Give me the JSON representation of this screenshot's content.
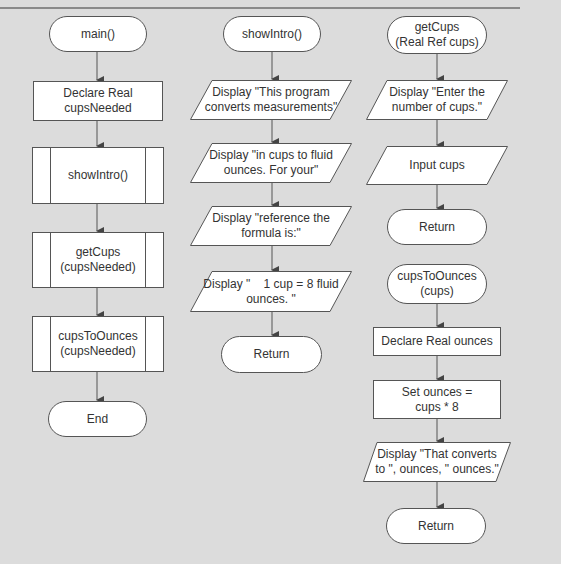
{
  "diagram": {
    "type": "flowchart",
    "columns": [
      {
        "name": "main",
        "nodes": [
          {
            "shape": "terminal",
            "label": "main()"
          },
          {
            "shape": "process",
            "label": "Declare Real\ncupsNeeded"
          },
          {
            "shape": "predefined-process",
            "label": "showIntro()"
          },
          {
            "shape": "predefined-process",
            "label": "getCups\n(cupsNeeded)"
          },
          {
            "shape": "predefined-process",
            "label": "cupsToOunces\n(cupsNeeded)"
          },
          {
            "shape": "terminal",
            "label": "End"
          }
        ]
      },
      {
        "name": "showIntro",
        "nodes": [
          {
            "shape": "terminal",
            "label": "showIntro()"
          },
          {
            "shape": "io",
            "label": "Display \"This program\nconverts measurements\""
          },
          {
            "shape": "io",
            "label": "Display \"in cups to fluid\nounces. For your\""
          },
          {
            "shape": "io",
            "label": "Display \"reference the\nformula is:\""
          },
          {
            "shape": "io",
            "label": "Display \"    1 cup = 8 fluid\nounces. \""
          },
          {
            "shape": "terminal",
            "label": "Return"
          }
        ]
      },
      {
        "name": "getCups",
        "nodes": [
          {
            "shape": "terminal",
            "label": "getCups\n(Real Ref cups)"
          },
          {
            "shape": "io",
            "label": "Display \"Enter the\nnumber of cups.\""
          },
          {
            "shape": "io",
            "label": "Input cups"
          },
          {
            "shape": "terminal",
            "label": "Return"
          }
        ]
      },
      {
        "name": "cupsToOunces",
        "nodes": [
          {
            "shape": "terminal",
            "label": "cupsToOunces\n(cups)"
          },
          {
            "shape": "process",
            "label": "Declare Real ounces"
          },
          {
            "shape": "process",
            "label": "Set ounces =\ncups * 8"
          },
          {
            "shape": "io",
            "label": "Display \"That converts\nto \", ounces, \" ounces.\""
          },
          {
            "shape": "terminal",
            "label": "Return"
          }
        ]
      }
    ]
  },
  "labels": {
    "main_start": "main()",
    "main_declare": "Declare Real\ncupsNeeded",
    "main_showintro": "showIntro()",
    "main_getcups": "getCups\n(cupsNeeded)",
    "main_cupstoounces": "cupsToOunces\n(cupsNeeded)",
    "main_end": "End",
    "si_start": "showIntro()",
    "si_d1": "Display \"This program\nconverts measurements\"",
    "si_d2": "Display \"in cups to fluid\nounces. For your\"",
    "si_d3": "Display \"reference the\nformula is:\"",
    "si_d4": "Display \"    1 cup = 8 fluid\nounces. \"",
    "si_return": "Return",
    "gc_start": "getCups\n(Real Ref cups)",
    "gc_d1": "Display \"Enter the\nnumber of cups.\"",
    "gc_input": "Input cups",
    "gc_return": "Return",
    "co_start": "cupsToOunces\n(cups)",
    "co_declare": "Declare Real ounces",
    "co_set": "Set ounces =\ncups * 8",
    "co_display": "Display \"That converts\nto \", ounces, \" ounces.\"",
    "co_return": "Return"
  },
  "colors": {
    "background": "#dcdcdc",
    "shape_fill": "#ffffff",
    "stroke": "#555555",
    "text": "#333333"
  }
}
